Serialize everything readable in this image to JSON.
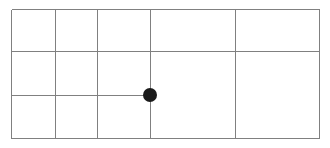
{
  "diagram": {
    "background_color": "#ffffff",
    "canvas": {
      "width": 330,
      "height": 148
    },
    "line_color": "#808080",
    "line_color_dark": "#6e6e6e",
    "line_width": 1,
    "frame": {
      "label": "outer-rectangle",
      "x1": 11,
      "y1": 9,
      "x2": 319,
      "y2": 138
    },
    "vertical_lines": [
      {
        "label": "left-border",
        "x": 11,
        "y1": 9,
        "y2": 138
      },
      {
        "label": "column-divider-1",
        "x": 55,
        "y1": 9,
        "y2": 138
      },
      {
        "label": "column-divider-2",
        "x": 97,
        "y1": 9,
        "y2": 138
      },
      {
        "label": "column-divider-3",
        "x": 150,
        "y1": 9,
        "y2": 138
      },
      {
        "label": "column-divider-4",
        "x": 235,
        "y1": 9,
        "y2": 138
      },
      {
        "label": "right-border",
        "x": 319,
        "y1": 9,
        "y2": 138
      }
    ],
    "horizontal_lines": [
      {
        "label": "top-border",
        "y": 9,
        "x1": 11,
        "x2": 319
      },
      {
        "label": "row-divider-1",
        "y": 51,
        "x1": 11,
        "x2": 319
      },
      {
        "label": "row-divider-2",
        "y": 95,
        "x1": 11,
        "x2": 150
      },
      {
        "label": "bottom-border",
        "y": 138,
        "x1": 11,
        "x2": 319
      }
    ],
    "node": {
      "label": "node-marker",
      "cx": 150,
      "cy": 95,
      "r": 7,
      "color": "#1a1a1a"
    },
    "columns": [
      {
        "label": "column-1",
        "x1": 11,
        "x2": 55,
        "width": 44
      },
      {
        "label": "column-2",
        "x1": 55,
        "x2": 97,
        "width": 42
      },
      {
        "label": "column-3",
        "x1": 97,
        "x2": 150,
        "width": 53
      },
      {
        "label": "column-4",
        "x1": 150,
        "x2": 235,
        "width": 85
      },
      {
        "label": "column-5",
        "x1": 235,
        "x2": 319,
        "width": 84
      }
    ],
    "rows": [
      {
        "label": "row-1",
        "y1": 9,
        "y2": 51,
        "height": 42
      },
      {
        "label": "row-2",
        "y1": 51,
        "y2": 95,
        "height": 44
      },
      {
        "label": "row-3",
        "y1": 95,
        "y2": 138,
        "height": 43
      }
    ]
  }
}
